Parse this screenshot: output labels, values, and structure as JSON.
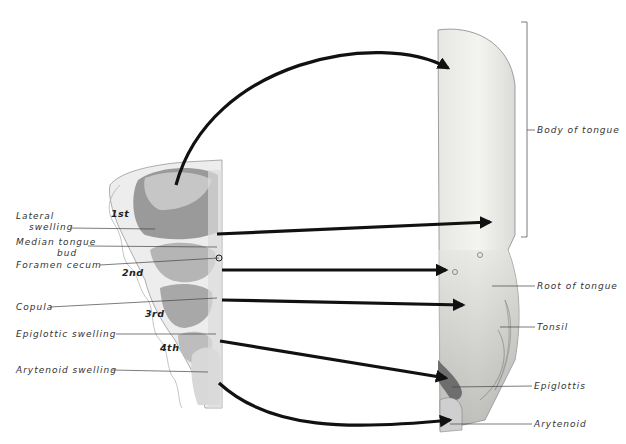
{
  "figure": {
    "arch_labels": [
      "1st",
      "2nd",
      "3rd",
      "4th"
    ],
    "left_labels": {
      "lateral_swelling_1": "Lateral",
      "lateral_swelling_2": "swelling",
      "median_tongue_bud_1": "Median tongue",
      "median_tongue_bud_2": "bud",
      "foramen_cecum": "Foramen  cecum",
      "copula": "Copula",
      "epiglottic_swelling": "Epiglottic  swelling",
      "arytenoid_swelling": "Arytenoid  swelling"
    },
    "right_labels": {
      "body_of_tongue": "Body of tongue",
      "root_of_tongue": "Root of tongue",
      "tonsil": "Tonsil",
      "epiglottis": "Epiglottis",
      "arytenoid": "Arytenoid"
    },
    "colors": {
      "arrow": "#111111",
      "leader": "#444444",
      "tongue_fill": "#eeeeea",
      "arch_fill": "#cfcfcf"
    }
  }
}
